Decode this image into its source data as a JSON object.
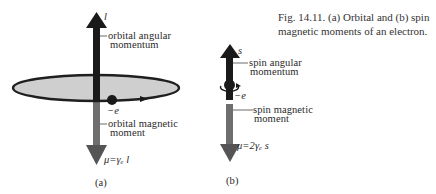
{
  "figure": {
    "caption_line1": "Fig. 14.11. (a) Orbital and (b) spin",
    "caption_line2": "magnetic moments of an electron."
  },
  "panel_a": {
    "label": "(a)",
    "vector_top": "l",
    "angular_label_line1": "orbital angular",
    "angular_label_line2": "momentum",
    "charge": "−e",
    "magnetic_label_line1": "orbital magnetic",
    "magnetic_label_line2": "moment",
    "equation": "μ=γₑ l"
  },
  "panel_b": {
    "label": "(b)",
    "vector_top": "s",
    "angular_label_line1": "spin angular",
    "angular_label_line2": "momentum",
    "charge": "−e",
    "magnetic_label_line1": "spin magnetic",
    "magnetic_label_line2": "moment",
    "equation": "μ=2γₑ s"
  },
  "colors": {
    "dark_arrow": "#1a1a1a",
    "grey_arrow": "#6e6e6e",
    "orbit_fill": "#cfcfcf"
  }
}
